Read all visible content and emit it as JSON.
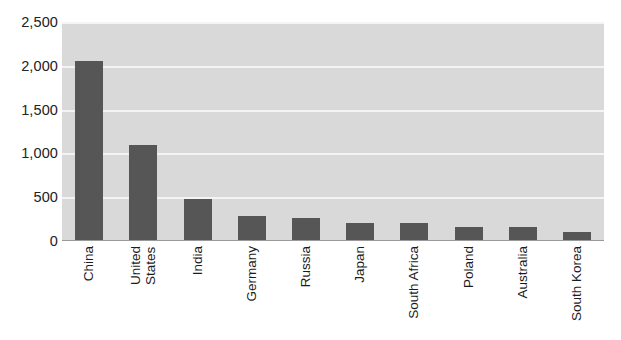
{
  "chart_data": {
    "type": "bar",
    "title": "",
    "subtitle": "",
    "xlabel": "",
    "ylabel": "",
    "orientation": "vertical",
    "grid": true,
    "legend": false,
    "legend_position": "none",
    "ylim": [
      0,
      2500
    ],
    "y_ticks": [
      0,
      500,
      1000,
      1500,
      2000,
      2500
    ],
    "y_tick_labels": [
      "0",
      "500",
      "1,000",
      "1,500",
      "2,000",
      "2,500"
    ],
    "categories": [
      "China",
      "United States",
      "India",
      "Germany",
      "Russia",
      "Japan",
      "South Africa",
      "Poland",
      "Australia",
      "South Korea"
    ],
    "category_lines": [
      [
        "China"
      ],
      [
        "United",
        "States"
      ],
      [
        "India"
      ],
      [
        "Germany"
      ],
      [
        "Russia"
      ],
      [
        "Japan"
      ],
      [
        "South Africa"
      ],
      [
        "Poland"
      ],
      [
        "Australia"
      ],
      [
        "South Korea"
      ]
    ],
    "values": [
      2060,
      1100,
      480,
      290,
      265,
      210,
      205,
      165,
      160,
      100
    ],
    "series": [
      {
        "name": "",
        "values": [
          2060,
          1100,
          480,
          290,
          265,
          210,
          205,
          165,
          160,
          100
        ]
      }
    ]
  },
  "colors": {
    "bar": "#565656",
    "plot_background": "#d9d9d9",
    "gridline": "#f4f4f4",
    "page_background": "#ffffff",
    "tick_label": "#222222",
    "axis_line": "#9a9a9a"
  }
}
